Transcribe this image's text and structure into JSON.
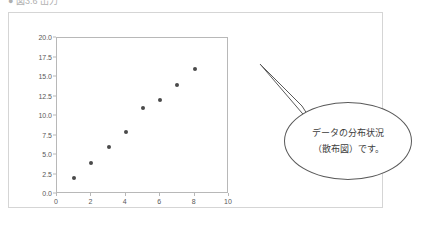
{
  "heading": {
    "text": "● 図3.6  出力"
  },
  "callout": {
    "lines": [
      "データの分布状況",
      "（散布図）です。"
    ]
  },
  "colors": {
    "marker": "#4a4a4a",
    "plot_border": "#b8b8b8",
    "frame_border": "#d5d5d5",
    "callout_border": "#5a5a5a",
    "tick_label": "#595959"
  },
  "chart_data": {
    "type": "scatter",
    "title": "",
    "xlabel": "",
    "ylabel": "",
    "xlim": [
      0,
      10
    ],
    "ylim": [
      0,
      20
    ],
    "xticks": [
      "0",
      "2",
      "4",
      "6",
      "8",
      "10"
    ],
    "xtick_values": [
      0,
      2,
      4,
      6,
      8,
      10
    ],
    "yticks": [
      "0.0",
      "2.5",
      "5.0",
      "7.5",
      "10.0",
      "12.5",
      "15.0",
      "17.5",
      "20.0"
    ],
    "ytick_values": [
      0,
      2.5,
      5,
      7.5,
      10,
      12.5,
      15,
      17.5,
      20
    ],
    "grid": false,
    "legend": null,
    "series": [
      {
        "name": "data",
        "x": [
          1,
          2,
          3,
          4,
          5,
          6,
          7,
          8
        ],
        "y": [
          2,
          4,
          6,
          8,
          11,
          12,
          14,
          16
        ]
      }
    ]
  }
}
